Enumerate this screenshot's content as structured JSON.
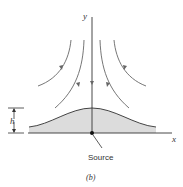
{
  "diagram": {
    "caption": "(b)",
    "axes": {
      "x_label": "x",
      "y_label": "y"
    },
    "height_label": "h",
    "source_label": "Source",
    "colors": {
      "line": "#555555",
      "hump_fill": "#d9d9d9",
      "hump_edge": "#444444",
      "axis": "#333333"
    },
    "streamlines": [
      {
        "id": "outer-left",
        "direction": "down"
      },
      {
        "id": "inner-left",
        "direction": "down"
      },
      {
        "id": "center",
        "direction": "down"
      },
      {
        "id": "inner-right",
        "direction": "down"
      },
      {
        "id": "outer-right",
        "direction": "down"
      }
    ]
  }
}
